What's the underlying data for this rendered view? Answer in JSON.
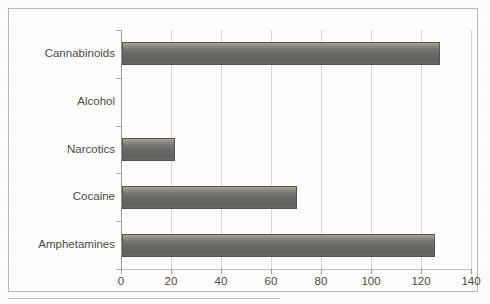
{
  "figure": {
    "background_color": "#ffffff",
    "frame_color": "#b9b9b9",
    "bar_color": "#6a6864",
    "bar_outline_color": "#55534f",
    "gridline_color": "#d6d6d6",
    "axis_color": "#9b9b9b",
    "text_color": "#4a4a4a"
  },
  "chart_data": {
    "type": "bar",
    "orientation": "horizontal",
    "title": "",
    "xlabel": "",
    "ylabel": "",
    "categories": [
      "Amphetamines",
      "Cocaine",
      "Narcotics",
      "Alcohol",
      "Cannabinoids"
    ],
    "values": [
      125,
      70,
      21,
      0,
      127
    ],
    "xlim": [
      0,
      140
    ],
    "xticks": [
      0,
      20,
      40,
      60,
      80,
      100,
      120,
      140
    ],
    "xtick_labels": [
      "0",
      "20",
      "40",
      "60",
      "80",
      "100",
      "120",
      "140"
    ],
    "grid": true,
    "grid_axis": "x",
    "legend": false,
    "legend_position": "none",
    "series": [
      {
        "name": "Count",
        "values": [
          125,
          70,
          21,
          0,
          127
        ]
      }
    ]
  }
}
